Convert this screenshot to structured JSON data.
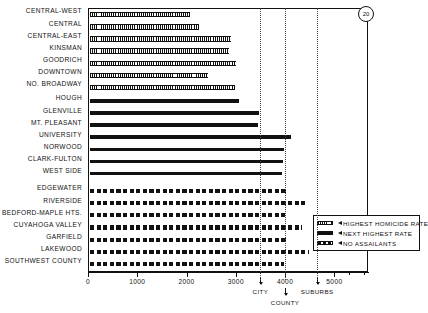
{
  "figure": {
    "badge": "20"
  },
  "legend": {
    "items": [
      {
        "label": "HIGHEST HOMICIDE RATE",
        "pattern": "hatch",
        "icon": "fine-hatch-swatch"
      },
      {
        "label": "NEXT HIGHEST RATE",
        "pattern": "solid",
        "icon": "solid-swatch"
      },
      {
        "label": "NO ASSAILANTS",
        "pattern": "dash",
        "icon": "dashed-swatch"
      }
    ]
  },
  "annotations": [
    {
      "label": "CITY",
      "value": 3500
    },
    {
      "label": "COUNTY",
      "value": 4000
    },
    {
      "label": "SUBURBS",
      "value": 4650
    }
  ],
  "chart_data": {
    "type": "bar",
    "orientation": "horizontal",
    "title": "",
    "xlabel": "",
    "ylabel": "",
    "xlim": [
      0,
      5700
    ],
    "ticks": [
      0,
      1000,
      2000,
      3000,
      4000,
      5000
    ],
    "tick_labels": [
      "0",
      "1000",
      "2000",
      "3000",
      "4000",
      "5000"
    ],
    "grid": false,
    "legend_position": "bottom-right",
    "reference_lines": [
      {
        "label": "CITY",
        "value": 3500
      },
      {
        "label": "COUNTY",
        "value": 4000
      },
      {
        "label": "SUBURBS",
        "value": 4650
      }
    ],
    "groups": [
      {
        "name": "HIGHEST HOMICIDE RATE",
        "pattern": "hatch",
        "categories": [
          "CENTRAL-WEST",
          "CENTRAL",
          "CENTRAL-EAST",
          "KINSMAN",
          "GOODRICH",
          "DOWNTOWN",
          "NO. BROADWAY"
        ],
        "values": [
          2040,
          2220,
          2880,
          2840,
          2980,
          2400,
          2960
        ]
      },
      {
        "name": "NEXT HIGHEST RATE",
        "pattern": "solid",
        "categories": [
          "HOUGH",
          "GLENVILLE",
          "MT. PLEASANT",
          "UNIVERSITY",
          "NORWOOD",
          "CLARK-FULTON",
          "WEST SIDE"
        ],
        "values": [
          3030,
          3440,
          3420,
          4080,
          3950,
          3920,
          3900
        ]
      },
      {
        "name": "NO ASSAILANTS",
        "pattern": "dash",
        "categories": [
          "EDGEWATER",
          "RIVERSIDE",
          "BEDFORD-MAPLE HTS.",
          "CUYAHOGA VALLEY",
          "GARFIELD",
          "LAKEWOOD",
          "SOUTHWEST COUNTY"
        ],
        "values": [
          3980,
          4420,
          3960,
          4320,
          4020,
          4450,
          3950
        ]
      }
    ]
  }
}
